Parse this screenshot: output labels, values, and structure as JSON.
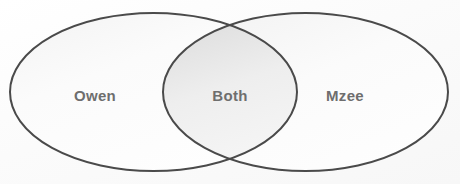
{
  "diagram": {
    "type": "venn",
    "title": "",
    "background_color": "#fdfdfd",
    "stroke_color": "#4a4a4a",
    "stroke_width": 2,
    "label_color": "#6e6e6e",
    "fill_left": "#fafafa",
    "fill_right": "#fafafa",
    "fill_overlap": "#ececec",
    "sets": [
      {
        "id": "left",
        "label": "Owen",
        "cx": 153.5,
        "cy": 92,
        "rx": 143.5,
        "ry": 79,
        "label_x": 95,
        "label_y": 95
      },
      {
        "id": "right",
        "label": "Mzee",
        "cx": 305.5,
        "cy": 92,
        "rx": 142.5,
        "ry": 79,
        "label_x": 345,
        "label_y": 95
      }
    ],
    "overlap": {
      "id": "intersection",
      "label": "Both",
      "label_x": 230,
      "label_y": 95
    }
  }
}
